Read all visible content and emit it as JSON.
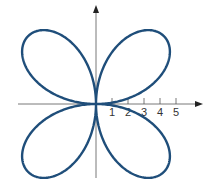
{
  "chart_data": {
    "type": "line",
    "title": "",
    "equation": "r = 6 sin(2θ)",
    "xlabel": "",
    "ylabel": "",
    "x_ticks": [
      "1",
      "2",
      "3",
      "4",
      "5"
    ],
    "xlim": [
      -6,
      6.5
    ],
    "ylim": [
      -6,
      6.5
    ],
    "grid": false,
    "legend": false,
    "amplitude": 6,
    "petals": 4,
    "curve_color": "#1f4e7a",
    "axis_color": "#555555"
  }
}
